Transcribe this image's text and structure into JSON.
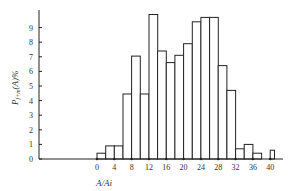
{
  "chart_data": {
    "type": "bar",
    "title": "",
    "xlabel": "A/Ai",
    "ylabel": "P_{f+m}(A)%",
    "xlim": [
      -20,
      42
    ],
    "ylim": [
      0,
      10
    ],
    "grid": false,
    "legend": null,
    "x_ticks": [
      0,
      4,
      8,
      12,
      16,
      20,
      24,
      28,
      32,
      36,
      40
    ],
    "y_ticks": [
      0,
      1,
      2,
      3,
      4,
      5,
      6,
      7,
      8,
      9
    ],
    "bins": [
      {
        "start": 0,
        "end": 2,
        "value": 0.4
      },
      {
        "start": 2,
        "end": 4,
        "value": 0.9
      },
      {
        "start": 4,
        "end": 6,
        "value": 0.9
      },
      {
        "start": 6,
        "end": 8,
        "value": 4.45
      },
      {
        "start": 8,
        "end": 10,
        "value": 7.05
      },
      {
        "start": 10,
        "end": 12,
        "value": 4.45
      },
      {
        "start": 12,
        "end": 14,
        "value": 9.9
      },
      {
        "start": 14,
        "end": 16,
        "value": 7.4
      },
      {
        "start": 16,
        "end": 18,
        "value": 6.6
      },
      {
        "start": 18,
        "end": 20,
        "value": 7.1
      },
      {
        "start": 20,
        "end": 22,
        "value": 7.9
      },
      {
        "start": 22,
        "end": 24,
        "value": 9.4
      },
      {
        "start": 24,
        "end": 26,
        "value": 9.7
      },
      {
        "start": 26,
        "end": 28,
        "value": 9.7
      },
      {
        "start": 28,
        "end": 30,
        "value": 6.4
      },
      {
        "start": 30,
        "end": 32,
        "value": 4.7
      },
      {
        "start": 32,
        "end": 34,
        "value": 0.7
      },
      {
        "start": 34,
        "end": 36,
        "value": 1.0
      },
      {
        "start": 36,
        "end": 38,
        "value": 0.4
      },
      {
        "start": 40,
        "end": 41,
        "value": 0.6
      }
    ]
  },
  "labels": {
    "ylabel_main": "P",
    "ylabel_sub": "f+m",
    "ylabel_rest": "(A)%",
    "xlabel": "A/Ai"
  }
}
